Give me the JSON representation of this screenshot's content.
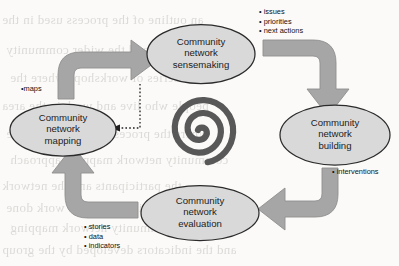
{
  "figure": {
    "type": "cycle-diagram",
    "center_icon": "spiral-icon",
    "background_color": "#fbfaf8",
    "node_fill": "#d9d9d9",
    "node_stroke": "#2b2b2b",
    "arrow_fill": "#a6a6a6",
    "arrow_stroke": "#8c8c8c",
    "spiral_color": "#585858"
  },
  "nodes": [
    {
      "id": "sensemaking",
      "name": "node-sensemaking",
      "lines": [
        "Community",
        "network",
        "sensemaking"
      ],
      "position": "top"
    },
    {
      "id": "building",
      "name": "node-building",
      "lines": [
        "Community",
        "network",
        "building"
      ],
      "position": "right"
    },
    {
      "id": "evaluation",
      "name": "node-evaluation",
      "lines": [
        "Community",
        "network",
        "evaluation"
      ],
      "position": "bottom"
    },
    {
      "id": "mapping",
      "name": "node-mapping",
      "lines": [
        "Community",
        "network",
        "mapping"
      ],
      "position": "left"
    }
  ],
  "edge_labels": [
    {
      "id": "maps",
      "name": "edge-label-maps",
      "items": [
        "maps"
      ],
      "position": "left-upper",
      "edge": "mapping-to-sensemaking"
    },
    {
      "id": "outputs",
      "name": "edge-label-outputs",
      "items": [
        "issues",
        "priorities",
        "next actions"
      ],
      "position": "top-right",
      "edge": "sensemaking-to-building"
    },
    {
      "id": "interventions",
      "name": "edge-label-interventions",
      "items": [
        "interventions"
      ],
      "position": "right-lower",
      "edge": "building-to-evaluation"
    },
    {
      "id": "evidence",
      "name": "edge-label-evidence",
      "items": [
        "stories",
        "data",
        "indicators"
      ],
      "position": "bottom-left",
      "edge": "evaluation-to-mapping"
    }
  ],
  "arrows": [
    {
      "id": "mapping-to-sensemaking",
      "name": "arrow-mapping-to-sensemaking",
      "style": "solid-block",
      "direction": "up-then-right"
    },
    {
      "id": "sensemaking-to-building",
      "name": "arrow-sensemaking-to-building",
      "style": "solid-block",
      "direction": "right-then-down"
    },
    {
      "id": "building-to-evaluation",
      "name": "arrow-building-to-evaluation",
      "style": "solid-block",
      "direction": "down-then-left"
    },
    {
      "id": "evaluation-to-mapping",
      "name": "arrow-evaluation-to-mapping",
      "style": "solid-block",
      "direction": "left-then-up"
    },
    {
      "id": "sensemaking-to-mapping-feedback",
      "name": "arrow-feedback-dotted",
      "style": "dotted",
      "direction": "down-then-left"
    }
  ],
  "bullet_glyph": "•",
  "background_text": [
    "an outline of the process used in the",
    "the participants and the wider community",
    "in a series of workshops where the",
    "people who live and work in the area",
    "where the process is applied and the",
    "community network mapping approach",
    "the participants and the network",
    "to assess the impact of the work done",
    "using the community network mapping",
    "and the indicators developed by the group"
  ]
}
